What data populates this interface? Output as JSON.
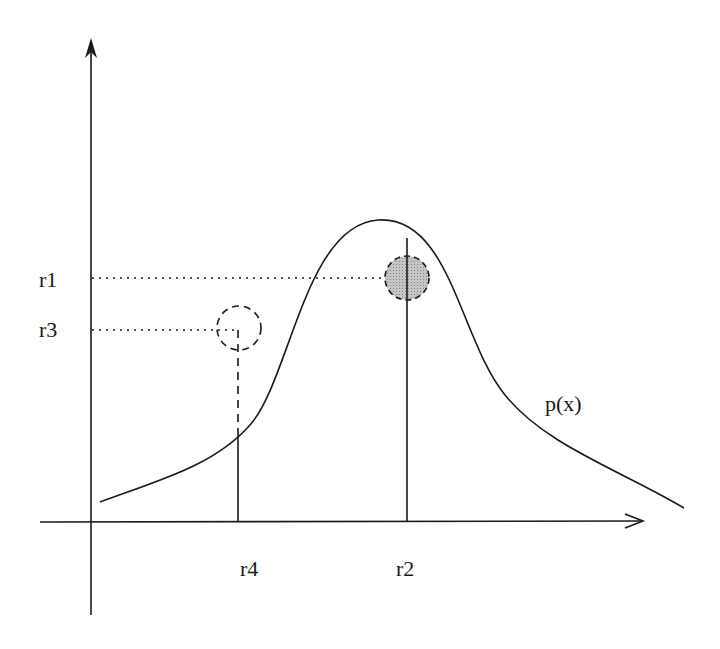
{
  "diagram": {
    "type": "probability-density-sampling",
    "curve_label": "p(x)",
    "y_axis_labels": {
      "r1": "r1",
      "r3": "r3"
    },
    "x_axis_labels": {
      "r4": "r4",
      "r2": "r2"
    },
    "accepted_sample": {
      "x_label": "r2",
      "y_label": "r1",
      "style": "filled-gray-dashed-circle"
    },
    "rejected_sample": {
      "x_label": "r4",
      "y_label": "r3",
      "style": "empty-dashed-circle"
    },
    "colors": {
      "stroke": "#1a1a1a",
      "accepted_fill": "#b0b0b0",
      "background": "#ffffff"
    }
  }
}
